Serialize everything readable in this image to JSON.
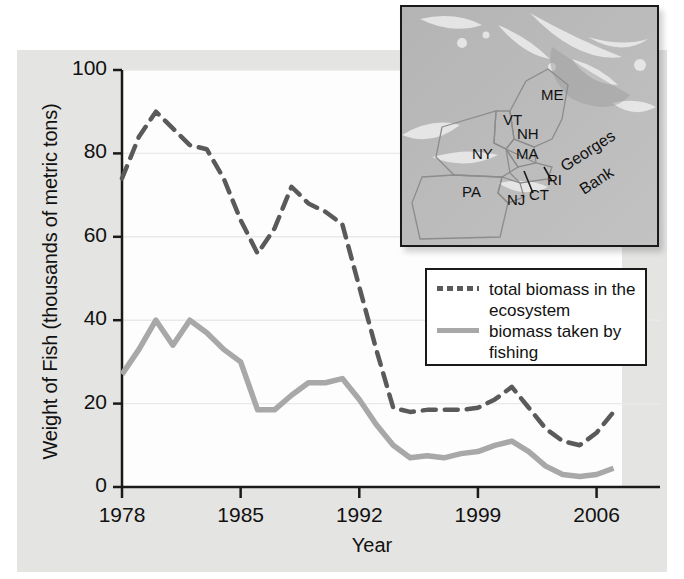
{
  "chart_data": {
    "type": "line",
    "title": "",
    "xlabel": "Year",
    "ylabel": "Weight of Fish (thousands of metric tons)",
    "xlim": [
      1978,
      2007.5
    ],
    "ylim": [
      0,
      100
    ],
    "xticks": [
      "1978",
      "1985",
      "1992",
      "1999",
      "2006"
    ],
    "xtick_values": [
      1978,
      1985,
      1992,
      1999,
      2006
    ],
    "yticks": [
      "0",
      "20",
      "40",
      "60",
      "80",
      "100"
    ],
    "ytick_values": [
      0,
      20,
      40,
      60,
      80,
      100
    ],
    "grid": "horizontal",
    "legend_position": "center-right",
    "x": [
      1978,
      1979,
      1980,
      1981,
      1982,
      1983,
      1984,
      1985,
      1986,
      1987,
      1988,
      1989,
      1990,
      1991,
      1992,
      1993,
      1994,
      1995,
      1996,
      1997,
      1998,
      1999,
      2000,
      2001,
      2002,
      2003,
      2004,
      2005,
      2006,
      2007
    ],
    "series": [
      {
        "name": "total biomass in the ecosystem",
        "style": "dashed",
        "color": "#5a5a5a",
        "values": [
          74,
          84,
          90,
          86,
          82,
          81,
          74,
          64,
          56,
          62,
          72,
          68,
          66,
          63,
          48,
          33,
          19,
          18,
          18.5,
          18.5,
          18.5,
          19,
          21,
          24,
          19,
          14,
          11,
          10,
          13,
          18
        ]
      },
      {
        "name": "biomass taken by fishing",
        "style": "solid",
        "color": "#a8a8a8",
        "values": [
          27,
          33,
          40,
          34,
          40,
          37,
          33,
          30,
          18.5,
          18.5,
          22,
          25,
          25,
          26,
          21,
          15,
          10,
          7,
          7.5,
          7,
          8,
          8.5,
          10,
          11,
          8.5,
          5,
          3,
          2.5,
          3,
          4.5
        ]
      }
    ]
  },
  "legend": {
    "entries": [
      {
        "label": "total biomass in the ecosystem",
        "swatch": "dashed-line-swatch"
      },
      {
        "label": "biomass taken by fishing",
        "swatch": "solid-line-swatch"
      }
    ]
  },
  "inset_map": {
    "name": "northeast-us-georges-bank-map",
    "labels": [
      {
        "text": "ME",
        "x": 139,
        "y": 93
      },
      {
        "text": "VT",
        "x": 101,
        "y": 118
      },
      {
        "text": "NH",
        "x": 115,
        "y": 132
      },
      {
        "text": "NY",
        "x": 70,
        "y": 152
      },
      {
        "text": "MA",
        "x": 114,
        "y": 152
      },
      {
        "text": "RI",
        "x": 145,
        "y": 178
      },
      {
        "text": "CT",
        "x": 127,
        "y": 193
      },
      {
        "text": "NJ",
        "x": 105,
        "y": 198
      },
      {
        "text": "PA",
        "x": 60,
        "y": 190
      },
      {
        "text": "Georges",
        "x": 163,
        "y": 165
      },
      {
        "text": "Bank",
        "x": 182,
        "y": 188
      }
    ]
  }
}
